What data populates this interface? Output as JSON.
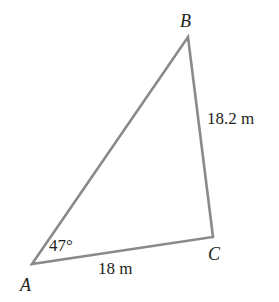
{
  "diagram": {
    "type": "triangle",
    "stroke_color": "#8a8a8a",
    "text_color": "#231f20",
    "vertices": {
      "A": {
        "label": "A",
        "x": 32,
        "y": 264
      },
      "B": {
        "label": "B",
        "x": 188,
        "y": 37
      },
      "C": {
        "label": "C",
        "x": 213,
        "y": 237
      }
    },
    "angle_A": "47°",
    "side_AC": "18 m",
    "side_BC": "18.2 m"
  }
}
